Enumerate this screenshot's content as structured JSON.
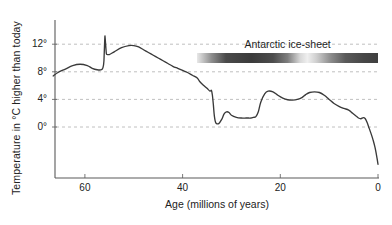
{
  "chart_data": {
    "type": "line",
    "title": "",
    "xlabel": "Age (millions of years)",
    "ylabel": "Temperature in °C  higher than today",
    "xlim": [
      67,
      0
    ],
    "ylim": [
      -7,
      14.5
    ],
    "x_ticks": [
      60,
      40,
      20,
      0
    ],
    "x_tick_labels": [
      "60",
      "40",
      "20",
      "0"
    ],
    "y_ticks": [
      12,
      8,
      4,
      0
    ],
    "y_tick_labels": [
      "12°",
      "8°",
      "4°",
      "0°"
    ],
    "grid": true,
    "grid_style": "dashed-horizontal",
    "legend": "none",
    "series": [
      {
        "name": "Global temperature anomaly",
        "color": "#3a3a3a",
        "x": [
          66.5,
          65.5,
          64.0,
          62.5,
          61.0,
          59.5,
          58.5,
          57.5,
          56.6,
          56.3,
          56.1,
          55.9,
          55.6,
          55.0,
          54.0,
          52.5,
          51.0,
          50.0,
          49.0,
          48.0,
          47.0,
          46.0,
          45.0,
          44.0,
          43.0,
          42.0,
          41.0,
          40.0,
          39.0,
          38.0,
          37.0,
          36.5,
          35.8,
          35.0,
          34.4,
          34.1,
          33.9,
          33.7,
          33.5,
          33.2,
          32.6,
          32.0,
          31.5,
          31.0,
          30.5,
          30.0,
          29.0,
          28.0,
          27.0,
          26.5,
          26.0,
          25.5,
          25.0,
          24.5,
          24.0,
          23.2,
          22.5,
          21.5,
          20.5,
          19.5,
          18.5,
          17.5,
          16.5,
          15.5,
          14.8,
          14.0,
          13.0,
          12.0,
          11.0,
          10.0,
          9.0,
          8.0,
          7.0,
          6.0,
          5.2,
          4.5,
          4.0,
          3.5,
          3.0,
          2.6,
          2.2,
          1.8,
          1.4,
          1.0,
          0.6,
          0.2,
          0.0
        ],
        "y": [
          7.4,
          7.9,
          8.4,
          8.9,
          9.1,
          8.9,
          8.5,
          8.3,
          8.3,
          8.6,
          9.6,
          13.2,
          10.6,
          10.5,
          10.9,
          11.5,
          11.8,
          11.8,
          11.6,
          11.2,
          10.8,
          10.4,
          10.0,
          9.6,
          9.2,
          8.8,
          8.5,
          8.2,
          7.9,
          7.5,
          7.1,
          6.6,
          6.1,
          5.6,
          5.2,
          5.3,
          4.6,
          3.2,
          1.6,
          0.6,
          0.5,
          1.1,
          1.9,
          2.2,
          2.1,
          1.7,
          1.4,
          1.3,
          1.3,
          1.3,
          1.3,
          1.4,
          1.5,
          2.2,
          3.6,
          4.8,
          5.2,
          5.1,
          4.6,
          4.2,
          3.95,
          3.9,
          4.0,
          4.3,
          4.7,
          5.0,
          5.1,
          5.0,
          4.6,
          4.0,
          3.4,
          3.0,
          2.7,
          2.45,
          2.0,
          1.6,
          1.3,
          1.2,
          1.35,
          1.2,
          0.6,
          -0.2,
          -1.0,
          -1.9,
          -3.0,
          -4.5,
          -5.4
        ]
      }
    ],
    "annotations": [
      {
        "name": "antarctic-ice-sheet-bar",
        "label": "Antarctic ice-sheet",
        "x_start": 37.0,
        "x_end": 0.0,
        "kind": "gradient-bar"
      }
    ]
  },
  "axes": {
    "y_title": "Temperature in °C  higher than today",
    "x_title": "Age (millions of years)"
  }
}
